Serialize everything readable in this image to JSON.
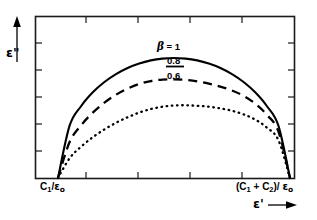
{
  "figure": {
    "name": "cole-cole-plot",
    "background_color": "#ffffff",
    "frame_color": "#1a1a1a",
    "curve_color": "#000000"
  },
  "axes": {
    "y": {
      "label_text": "ε",
      "label_prime": "\"",
      "label_full": "ε\"",
      "arrow": "up",
      "tick_count": 5
    },
    "x": {
      "label_text": "ε",
      "label_prime": "'",
      "label_full": "ε'",
      "arrow": "right",
      "tick_count": 4
    },
    "x_tick_captions": [
      {
        "name": "left-endpoint",
        "numerator": "C",
        "sub1": "1",
        "divider": "/",
        "denominator": "ε",
        "sub2": "o",
        "text": "C1/εo"
      },
      {
        "name": "right-endpoint",
        "numerator": "(C",
        "sub1": "1",
        "plus": " + C",
        "sub2": "2",
        "close": ")/ ",
        "denominator": "ε",
        "sub3": "o",
        "text": "(C1 + C2)/ εo"
      }
    ]
  },
  "curve_labels": [
    {
      "name": "beta-equals-one",
      "beta": "β",
      "equals": " = ",
      "value": "1",
      "text": "β = 1"
    },
    {
      "name": "beta-point-eight",
      "text": "0.8"
    },
    {
      "name": "beta-point-six",
      "text": "0.6"
    }
  ],
  "chart_data": {
    "type": "line",
    "title": "",
    "xlabel": "ε'",
    "ylabel": "ε\"",
    "grid": false,
    "legend": "inline-curve-labels",
    "xlim": [
      0,
      1
    ],
    "ylim": [
      0,
      1
    ],
    "x_axis_ticks": [
      "C1/εo",
      "(C1 + C2)/εo"
    ],
    "series": [
      {
        "name": "β = 1",
        "beta": 1.0,
        "style": "solid",
        "peak_relative_height": 1.0,
        "x": [
          0.0,
          0.05,
          0.1,
          0.15,
          0.2,
          0.25,
          0.3,
          0.35,
          0.4,
          0.45,
          0.5,
          0.55,
          0.6,
          0.65,
          0.7,
          0.75,
          0.8,
          0.85,
          0.9,
          0.95,
          1.0
        ],
        "y": [
          0.0,
          0.436,
          0.6,
          0.714,
          0.8,
          0.866,
          0.917,
          0.954,
          0.98,
          0.995,
          1.0,
          0.995,
          0.98,
          0.954,
          0.917,
          0.866,
          0.8,
          0.714,
          0.6,
          0.436,
          0.0
        ]
      },
      {
        "name": "0.8",
        "beta": 0.8,
        "style": "dashed",
        "peak_relative_height": 0.82,
        "x": [
          0.0,
          0.05,
          0.1,
          0.15,
          0.2,
          0.25,
          0.3,
          0.35,
          0.4,
          0.45,
          0.5,
          0.55,
          0.6,
          0.65,
          0.7,
          0.75,
          0.8,
          0.85,
          0.9,
          0.95,
          1.0
        ],
        "y": [
          0.0,
          0.3,
          0.44,
          0.545,
          0.628,
          0.694,
          0.745,
          0.784,
          0.808,
          0.82,
          0.822,
          0.818,
          0.806,
          0.787,
          0.762,
          0.729,
          0.684,
          0.62,
          0.527,
          0.388,
          0.0
        ]
      },
      {
        "name": "0.6",
        "beta": 0.6,
        "style": "dotted",
        "peak_relative_height": 0.6,
        "x": [
          0.0,
          0.05,
          0.1,
          0.15,
          0.2,
          0.25,
          0.3,
          0.35,
          0.4,
          0.45,
          0.5,
          0.55,
          0.6,
          0.65,
          0.7,
          0.75,
          0.8,
          0.85,
          0.9,
          0.95,
          1.0
        ],
        "y": [
          0.0,
          0.165,
          0.262,
          0.34,
          0.405,
          0.46,
          0.506,
          0.545,
          0.575,
          0.594,
          0.604,
          0.606,
          0.602,
          0.594,
          0.58,
          0.56,
          0.53,
          0.487,
          0.42,
          0.316,
          0.0
        ]
      }
    ]
  }
}
